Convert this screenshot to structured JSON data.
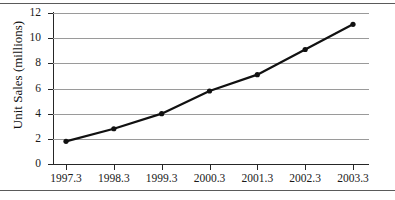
{
  "chart_data": {
    "type": "line",
    "title": "",
    "xlabel": "",
    "ylabel": "Unit Sales (millions)",
    "categories": [
      "1997.3",
      "1998.3",
      "1999.3",
      "2000.3",
      "2001.3",
      "2002.3",
      "2003.3"
    ],
    "x": [
      1997.3,
      1998.3,
      1999.3,
      2000.3,
      2001.3,
      2002.3,
      2003.3
    ],
    "values": [
      1.8,
      2.8,
      4.0,
      5.8,
      7.1,
      9.1,
      11.1
    ],
    "series": [
      {
        "name": "Unit Sales",
        "values": [
          1.8,
          2.8,
          4.0,
          5.8,
          7.1,
          9.1,
          11.1
        ],
        "color": "#111111",
        "marker": "circle",
        "line_width": 2.2
      }
    ],
    "ylim": [
      0,
      12
    ],
    "yticks": [
      0,
      2,
      4,
      6,
      8,
      10,
      12
    ],
    "ytick_labels": [
      "0",
      "2",
      "4",
      "6",
      "8",
      "10",
      "12"
    ],
    "xticks": [
      1997.3,
      1998.3,
      1999.3,
      2000.3,
      2001.3,
      2002.3,
      2003.3
    ],
    "xtick_labels": [
      "1997.3",
      "1998.3",
      "1999.3",
      "2000.3",
      "2001.3",
      "2002.3",
      "2003.3"
    ],
    "grid": {
      "horizontal": true,
      "vertical": false,
      "color": "#9a9a9a"
    },
    "legend": {
      "visible": false,
      "position": "none",
      "entries": []
    },
    "annotations": [],
    "axis_color": "#262626",
    "background": "#ffffff"
  },
  "figure": {
    "rule_color": "#5a5a5a",
    "top_rule": true,
    "bottom_rule": true
  }
}
